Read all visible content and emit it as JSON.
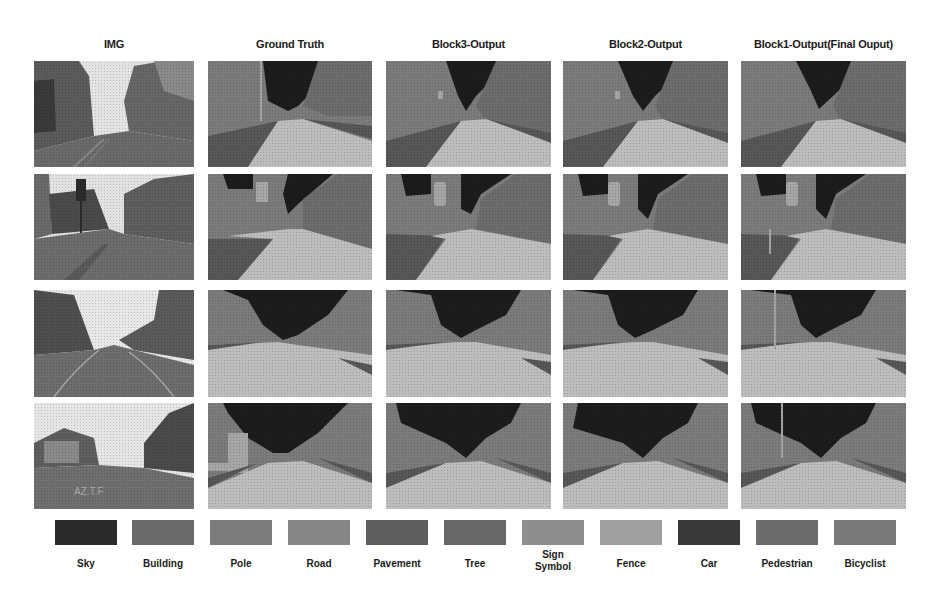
{
  "figure": {
    "columns": [
      {
        "title": "IMG",
        "kind": "photo"
      },
      {
        "title": "Ground Truth",
        "kind": "segmentation"
      },
      {
        "title": "Block3-Output",
        "kind": "segmentation"
      },
      {
        "title": "Block2-Output",
        "kind": "segmentation"
      },
      {
        "title": "Block1-Output(Final Ouput)",
        "kind": "segmentation"
      }
    ],
    "rows": 4,
    "legend": [
      {
        "label": "Sky",
        "color": "#2a2a2a"
      },
      {
        "label": "Building",
        "color": "#6a6a6a"
      },
      {
        "label": "Pole",
        "color": "#7c7c7c"
      },
      {
        "label": "Road",
        "color": "#858585"
      },
      {
        "label": "Pavement",
        "color": "#5e5e5e"
      },
      {
        "label": "Tree",
        "color": "#676767"
      },
      {
        "label": "Sign Symbol",
        "color": "#8e8e8e"
      },
      {
        "label": "Fence",
        "color": "#a0a0a0"
      },
      {
        "label": "Car",
        "color": "#393939"
      },
      {
        "label": "Pedestrian",
        "color": "#6c6c6c"
      },
      {
        "label": "Bicyclist",
        "color": "#787878"
      }
    ],
    "palette": {
      "sky": "#1c1c1c",
      "building": "#7e7e7e",
      "tree": "#6e6e6e",
      "road": "#bdbdbd",
      "pavement": "#575757",
      "pole": "#a6a6a6",
      "photo_sky": "#e6e6e6",
      "photo_building": "#5a5a5a",
      "photo_road": "#6f6f6f"
    }
  }
}
